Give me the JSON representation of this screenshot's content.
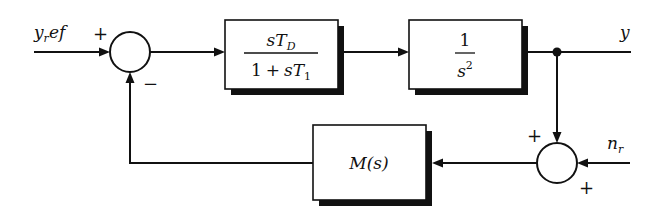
{
  "diagram": {
    "type": "control-loop-block-diagram",
    "signals": {
      "input_label": "y",
      "input_sub": "r",
      "input_suffix": "ef",
      "output_label": "y",
      "noise_label": "n",
      "noise_sub": "r"
    },
    "junctions": {
      "main": {
        "plus_sign": "+",
        "minus_sign": "−"
      },
      "sensor": {
        "plus_top": "+",
        "plus_bottom": "+"
      }
    },
    "blocks": {
      "controller": {
        "num_s": "s",
        "num_T": "T",
        "num_sub": "D",
        "den_one": "1",
        "den_plus": "+",
        "den_s": "s",
        "den_T": "T",
        "den_sub": "1"
      },
      "plant": {
        "num": "1",
        "den_s": "s",
        "den_exp": "2"
      },
      "sensor": {
        "label_M": "M",
        "label_args": "(s)"
      }
    },
    "colors": {
      "line": "#111111",
      "background": "#ffffff"
    }
  }
}
